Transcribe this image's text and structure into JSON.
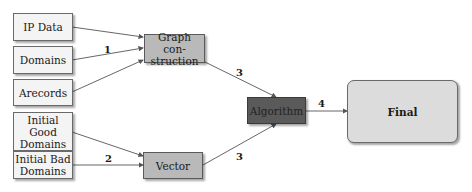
{
  "diagram": {
    "nodes": {
      "ip_data": "IP Data",
      "domains": "Domains",
      "arecords": "Arecords",
      "initial_good_domains": "Initial Good Domains",
      "initial_bad_domains": "Initial Bad Domains",
      "graph_construction": "Graph con-struction",
      "vector": "Vector",
      "algorithm": "Algorithm",
      "final": "Final"
    },
    "edge_labels": {
      "inputs_to_graph": "1",
      "inputs_to_vector": "2",
      "graph_to_algorithm": "3",
      "vector_to_algorithm": "3",
      "algorithm_to_final": "4"
    },
    "colors": {
      "input_fill": "#f4f4f4",
      "process_fill": "#b9b9b9",
      "algorithm_fill": "#5a5a5a",
      "final_fill": "#dcdcdc",
      "edge": "#555555"
    }
  }
}
